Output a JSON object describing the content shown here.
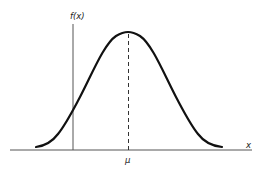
{
  "diagram": {
    "type": "normal-distribution-curve",
    "y_axis_label": "f(x)",
    "x_axis_label": "x",
    "mean_label": "μ",
    "colors": {
      "curve": "#111111",
      "axis": "#555555",
      "mean_line": "#333333",
      "background": "#ffffff"
    }
  }
}
